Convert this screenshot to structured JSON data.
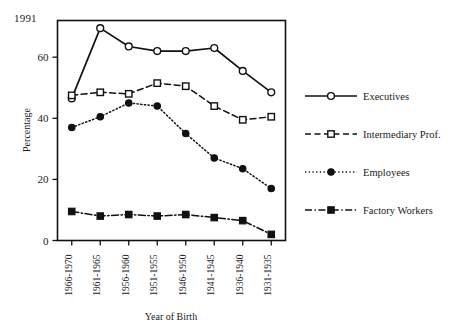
{
  "annotation": {
    "year_badge": "1991"
  },
  "chart_data": {
    "type": "line",
    "title": "",
    "xlabel": "Year of Birth",
    "ylabel": "Percentage",
    "categories": [
      "1966-1970",
      "1961-1965",
      "1956-1960",
      "1951-1955",
      "1946-1950",
      "1941-1945",
      "1936-1940",
      "1931-1935"
    ],
    "ylim": [
      0,
      72
    ],
    "yticks": [
      0,
      20,
      40,
      60
    ],
    "ytick_labels": [
      "0",
      "20",
      "40",
      "60"
    ],
    "grid": false,
    "legend_position": "right",
    "series": [
      {
        "name": "Executives",
        "values": [
          46.5,
          69.5,
          63.5,
          62.0,
          62.0,
          63.0,
          55.5,
          48.5
        ],
        "line_style": "solid",
        "marker": "open-circle",
        "color": "#111111"
      },
      {
        "name": "Intermediary Prof.",
        "values": [
          47.5,
          48.5,
          48.0,
          51.5,
          50.5,
          44.0,
          39.5,
          40.5
        ],
        "line_style": "dashed",
        "marker": "open-square",
        "color": "#111111"
      },
      {
        "name": "Employees",
        "values": [
          37.0,
          40.5,
          45.0,
          44.0,
          35.0,
          27.0,
          23.5,
          17.0
        ],
        "line_style": "dotted",
        "marker": "filled-circle",
        "color": "#111111"
      },
      {
        "name": "Factory Workers",
        "values": [
          9.5,
          8.0,
          8.5,
          8.0,
          8.5,
          7.5,
          6.5,
          2.0
        ],
        "line_style": "dashdot",
        "marker": "filled-square",
        "color": "#111111"
      }
    ]
  },
  "legend": {
    "items": [
      {
        "label": "Executives",
        "key": "legend-item-executives"
      },
      {
        "label": "Intermediary Prof.",
        "key": "legend-item-intermediary-prof"
      },
      {
        "label": "Employees",
        "key": "legend-item-employees"
      },
      {
        "label": "Factory Workers",
        "key": "legend-item-factory-workers"
      }
    ]
  }
}
